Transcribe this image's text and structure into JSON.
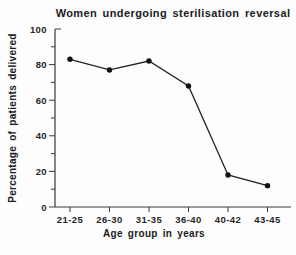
{
  "figure": {
    "title": "Women undergoing sterilisation reversal"
  },
  "chart_data": {
    "type": "line",
    "title": "Women undergoing sterilisation reversal",
    "categories": [
      "21-25",
      "26-30",
      "31-35",
      "36-40",
      "40-42",
      "43-45"
    ],
    "values": [
      83,
      77,
      82,
      68,
      18,
      12
    ],
    "xlabel": "Age group in years",
    "ylabel": "Percentage of patients delivered",
    "ylim": [
      0,
      100
    ],
    "y_major_ticks": [
      0,
      20,
      40,
      60,
      80,
      100
    ],
    "y_minor_step": 10,
    "grid": false,
    "legend": false,
    "marker": "filled-circle",
    "line_color": "#222222",
    "marker_color": "#111111",
    "axis_color": "#3a3a3a",
    "text_color": "#1b1b1b",
    "background_color": "#fdfdfd"
  }
}
